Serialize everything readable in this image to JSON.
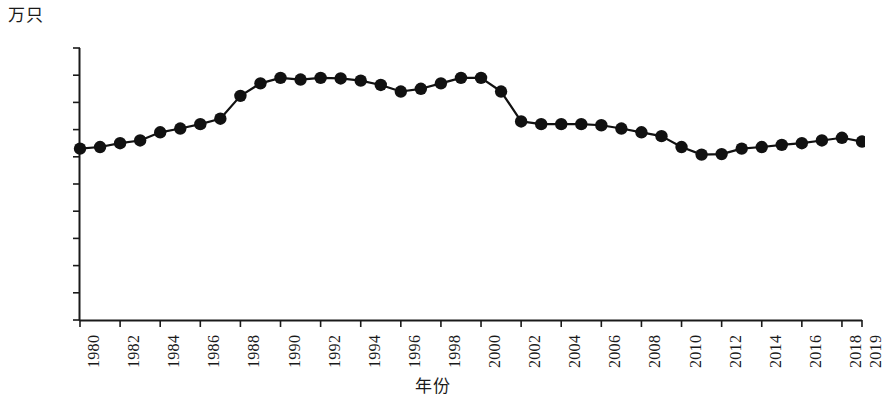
{
  "chart_data": {
    "type": "line",
    "title": "",
    "subtitle": "",
    "xlabel": "年份",
    "ylabel": "万只",
    "unit_label": "万只",
    "grid": false,
    "legend": null,
    "xlim": [
      1980,
      2019
    ],
    "ylim": [
      0,
      5000
    ],
    "ytick_labels": [
      "5 000",
      "4 500",
      "4 000",
      "3 500",
      "3 000",
      "2 500",
      "2 000",
      "1 500",
      "1 000",
      "500",
      "0"
    ],
    "ytick_values": [
      5000,
      4500,
      4000,
      3500,
      3000,
      2500,
      2000,
      1500,
      1000,
      500,
      0
    ],
    "xtick_labels": [
      "1980",
      "1982",
      "1984",
      "1986",
      "1988",
      "1990",
      "1992",
      "1994",
      "1996",
      "1998",
      "2000",
      "2002",
      "2004",
      "2006",
      "2008",
      "2010",
      "2012",
      "2014",
      "2016",
      "2018",
      "2019"
    ],
    "xtick_values": [
      1980,
      1982,
      1984,
      1986,
      1988,
      1990,
      1992,
      1994,
      1996,
      1998,
      2000,
      2002,
      2004,
      2006,
      2008,
      2010,
      2012,
      2014,
      2016,
      2018,
      2019
    ],
    "x": [
      1980,
      1981,
      1982,
      1983,
      1984,
      1985,
      1986,
      1987,
      1988,
      1989,
      1990,
      1991,
      1992,
      1993,
      1994,
      1995,
      1996,
      1997,
      1998,
      1999,
      2000,
      2001,
      2002,
      2003,
      2004,
      2005,
      2006,
      2007,
      2008,
      2009,
      2010,
      2011,
      2012,
      2013,
      2014,
      2015,
      2016,
      2017,
      2018,
      2019
    ],
    "values": [
      3150,
      3180,
      3250,
      3300,
      3450,
      3520,
      3600,
      3700,
      4120,
      4350,
      4450,
      4420,
      4450,
      4440,
      4400,
      4320,
      4200,
      4250,
      4350,
      4450,
      4450,
      4200,
      3650,
      3600,
      3600,
      3600,
      3580,
      3520,
      3450,
      3380,
      3180,
      3040,
      3050,
      3150,
      3180,
      3220,
      3250,
      3300,
      3350,
      3280
    ],
    "series_name": "存栏量",
    "marker": "circle",
    "marker_color": "#111111",
    "line_color": "#111111"
  }
}
